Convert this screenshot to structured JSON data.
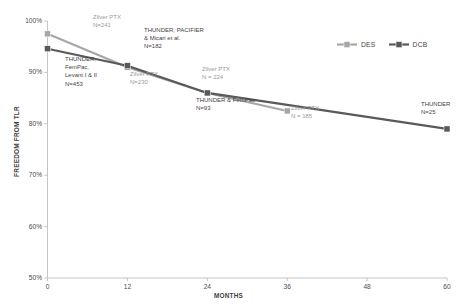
{
  "chart_data": {
    "type": "line",
    "title": "",
    "xlabel": "MONTHS",
    "ylabel": "FREEDOM FROM TLR",
    "xlim": [
      0,
      60
    ],
    "ylim": [
      50,
      100
    ],
    "xticks": [
      "0",
      "12",
      "24",
      "36",
      "48",
      "60"
    ],
    "xtick_values": [
      0,
      12,
      24,
      36,
      48,
      60
    ],
    "yticks": [
      "50%",
      "60%",
      "70%",
      "80%",
      "90%",
      "100%"
    ],
    "ytick_values": [
      50,
      60,
      70,
      80,
      90,
      100
    ],
    "grid": false,
    "legend_position": "top-right",
    "series": [
      {
        "name": "DES",
        "color": "#a6a6a6",
        "x": [
          0,
          12,
          24,
          36
        ],
        "values": [
          97.5,
          91.0,
          86.0,
          82.5
        ]
      },
      {
        "name": "DCB",
        "color": "#595959",
        "x": [
          0,
          12,
          24,
          60
        ],
        "values": [
          94.6,
          91.3,
          86.0,
          79.0
        ]
      }
    ],
    "annotations": [
      {
        "id": "zilver-ptx-241",
        "series": "DES",
        "text": "Zilver PTX\nN=241",
        "align": "center",
        "x": 93,
        "y": 13
      },
      {
        "id": "thunder-fempac-levant-453",
        "series": "DCB",
        "text": "THUNDER,\nFemPac,\nLevant I & II\nN=453",
        "align": "center",
        "x": 65,
        "y": 55
      },
      {
        "id": "thunder-pacifier-micari-182",
        "series": "DCB",
        "text": "THUNDER, PACIFIER\n& Micari et al.\nN=182",
        "align": "left",
        "x": 144,
        "y": 26
      },
      {
        "id": "zilver-ptx-230",
        "series": "DES",
        "text": "Zilver PTX\nN=230",
        "align": "center",
        "x": 130,
        "y": 70
      },
      {
        "id": "zilver-ptx-224",
        "series": "DES",
        "text": "Zilver PTX\nN = 224",
        "align": "center",
        "x": 202,
        "y": 65
      },
      {
        "id": "thunder-fempac-93",
        "series": "DCB",
        "text": "THUNDER & FemPac\nN=93",
        "align": "center",
        "x": 196,
        "y": 96
      },
      {
        "id": "zilver-ptx-185",
        "series": "DES",
        "text": "Zilver PTX\nN = 185",
        "align": "center",
        "x": 291,
        "y": 104
      },
      {
        "id": "thunder-25",
        "series": "DCB",
        "text": "THUNDER\nN=25",
        "align": "center",
        "x": 421,
        "y": 100
      }
    ]
  },
  "legend": {
    "items": [
      {
        "label": "DES",
        "color": "#a6a6a6"
      },
      {
        "label": "DCB",
        "color": "#595959"
      }
    ]
  }
}
